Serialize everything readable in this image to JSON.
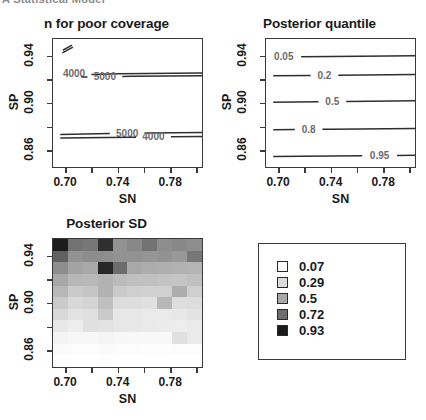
{
  "header": {
    "text": "A Statistical Model"
  },
  "panels": {
    "coverage": {
      "title": "n for poor coverage",
      "xlabel": "SN",
      "ylabel": "SP"
    },
    "quantile": {
      "title": "Posterior quantile",
      "xlabel": "SN",
      "ylabel": "SP"
    },
    "sd": {
      "title": "Posterior SD",
      "xlabel": "SN",
      "ylabel": "SP"
    }
  },
  "legend": {
    "entries": [
      {
        "label": "0.07",
        "color": "#ffffff"
      },
      {
        "label": "0.29",
        "color": "#dcdcdc"
      },
      {
        "label": "0.5",
        "color": "#a8a8a8"
      },
      {
        "label": "0.72",
        "color": "#6e6e6e"
      },
      {
        "label": "0.93",
        "color": "#1c1c1c"
      }
    ]
  },
  "chart_data": [
    {
      "type": "line",
      "id": "n-for-poor-coverage",
      "title": "n for poor coverage",
      "xlabel": "SN",
      "ylabel": "SP",
      "xlim": [
        0.69,
        0.805
      ],
      "ylim": [
        0.845,
        0.955
      ],
      "xticks": [
        0.7,
        0.74,
        0.78
      ],
      "xticks_minor": [
        0.72,
        0.76,
        0.8
      ],
      "yticks": [
        0.94,
        0.9,
        0.86
      ],
      "yticks_minor": [
        0.92,
        0.88
      ],
      "grid": false,
      "contours": [
        {
          "level": "4000",
          "label": "4000",
          "label_x": 0.706,
          "label_y": 0.9255,
          "points": [
            [
              0.6955,
              0.9245
            ],
            [
              0.74,
              0.9255
            ],
            [
              0.805,
              0.9262
            ]
          ]
        },
        {
          "level": "5000",
          "label": "5000",
          "label_x": 0.7295,
          "label_y": 0.9235,
          "points": [
            [
              0.7115,
              0.9228
            ],
            [
              0.75,
              0.9235
            ],
            [
              0.805,
              0.924
            ]
          ]
        },
        {
          "level": "5000",
          "label": "5000",
          "label_x": 0.7465,
          "label_y": 0.8755,
          "points": [
            [
              0.6955,
              0.8742
            ],
            [
              0.74,
              0.8752
            ],
            [
              0.805,
              0.876
            ]
          ]
        },
        {
          "level": "4000",
          "label": "4000",
          "label_x": 0.7665,
          "label_y": 0.8722,
          "points": [
            [
              0.6955,
              0.8712
            ],
            [
              0.75,
              0.8718
            ],
            [
              0.805,
              0.8726
            ]
          ]
        },
        {
          "level": "fragment-a",
          "label": "",
          "points": [
            [
              0.6975,
              0.9455
            ],
            [
              0.7045,
              0.9498
            ]
          ]
        },
        {
          "level": "fragment-b",
          "label": "",
          "points": [
            [
              0.6972,
              0.9432
            ],
            [
              0.7052,
              0.9482
            ]
          ]
        }
      ]
    },
    {
      "type": "line",
      "id": "posterior-quantile",
      "title": "Posterior quantile",
      "xlabel": "SN",
      "ylabel": "SP",
      "xlim": [
        0.69,
        0.805
      ],
      "ylim": [
        0.845,
        0.955
      ],
      "xticks": [
        0.7,
        0.74,
        0.78
      ],
      "xticks_minor": [
        0.72,
        0.76,
        0.8
      ],
      "yticks": [
        0.94,
        0.9,
        0.86
      ],
      "yticks_minor": [
        0.92,
        0.88
      ],
      "grid": false,
      "contours": [
        {
          "level": "0.05",
          "label": "0.05",
          "label_x": 0.7035,
          "label_y": 0.9405,
          "points": [
            [
              0.6955,
              0.9398
            ],
            [
              0.74,
              0.9402
            ],
            [
              0.805,
              0.9408
            ]
          ]
        },
        {
          "level": "0.2",
          "label": "0.2",
          "label_x": 0.7345,
          "label_y": 0.9245,
          "points": [
            [
              0.6955,
              0.9238
            ],
            [
              0.74,
              0.9243
            ],
            [
              0.805,
              0.925
            ]
          ]
        },
        {
          "level": "0.5",
          "label": "0.5",
          "label_x": 0.7405,
          "label_y": 0.9022,
          "points": [
            [
              0.6955,
              0.9015
            ],
            [
              0.74,
              0.902
            ],
            [
              0.805,
              0.9028
            ]
          ]
        },
        {
          "level": "0.8",
          "label": "0.8",
          "label_x": 0.7225,
          "label_y": 0.8788,
          "points": [
            [
              0.6955,
              0.8782
            ],
            [
              0.74,
              0.8786
            ],
            [
              0.805,
              0.8792
            ]
          ]
        },
        {
          "level": "0.95",
          "label": "0.95",
          "label_x": 0.7765,
          "label_y": 0.8562,
          "points": [
            [
              0.6955,
              0.8556
            ],
            [
              0.74,
              0.856
            ],
            [
              0.805,
              0.8566
            ]
          ]
        }
      ]
    },
    {
      "type": "heatmap",
      "id": "posterior-sd",
      "title": "Posterior SD",
      "xlabel": "SN",
      "ylabel": "SP",
      "xlim": [
        0.69,
        0.805
      ],
      "ylim": [
        0.845,
        0.955
      ],
      "xticks": [
        0.7,
        0.74,
        0.78
      ],
      "xticks_minor": [
        0.72,
        0.76,
        0.8
      ],
      "yticks": [
        0.94,
        0.9,
        0.86
      ],
      "yticks_minor": [
        0.92,
        0.88
      ],
      "colorscale": [
        "#ffffff",
        "#dcdcdc",
        "#a8a8a8",
        "#6e6e6e",
        "#1c1c1c"
      ],
      "zlim": [
        0.07,
        0.93
      ],
      "ncols": 10,
      "nrows": 11,
      "values": [
        [
          0.93,
          0.7,
          0.68,
          0.88,
          0.58,
          0.62,
          0.7,
          0.6,
          0.62,
          0.6
        ],
        [
          0.75,
          0.58,
          0.6,
          0.6,
          0.58,
          0.58,
          0.57,
          0.58,
          0.56,
          0.68
        ],
        [
          0.6,
          0.52,
          0.5,
          0.9,
          0.72,
          0.5,
          0.48,
          0.47,
          0.46,
          0.45
        ],
        [
          0.5,
          0.44,
          0.43,
          0.46,
          0.42,
          0.4,
          0.4,
          0.39,
          0.38,
          0.4
        ],
        [
          0.44,
          0.36,
          0.38,
          0.46,
          0.36,
          0.34,
          0.33,
          0.33,
          0.48,
          0.34
        ],
        [
          0.36,
          0.3,
          0.32,
          0.4,
          0.28,
          0.27,
          0.26,
          0.44,
          0.27,
          0.28
        ],
        [
          0.3,
          0.24,
          0.26,
          0.36,
          0.22,
          0.21,
          0.2,
          0.2,
          0.22,
          0.24
        ],
        [
          0.22,
          0.18,
          0.26,
          0.24,
          0.22,
          0.21,
          0.2,
          0.19,
          0.18,
          0.2
        ],
        [
          0.14,
          0.12,
          0.12,
          0.13,
          0.12,
          0.11,
          0.11,
          0.11,
          0.26,
          0.2
        ],
        [
          0.1,
          0.09,
          0.09,
          0.1,
          0.09,
          0.09,
          0.08,
          0.08,
          0.09,
          0.09
        ],
        [
          0.08,
          0.07,
          0.07,
          0.08,
          0.07,
          0.07,
          0.07,
          0.07,
          0.07,
          0.07
        ]
      ]
    }
  ]
}
